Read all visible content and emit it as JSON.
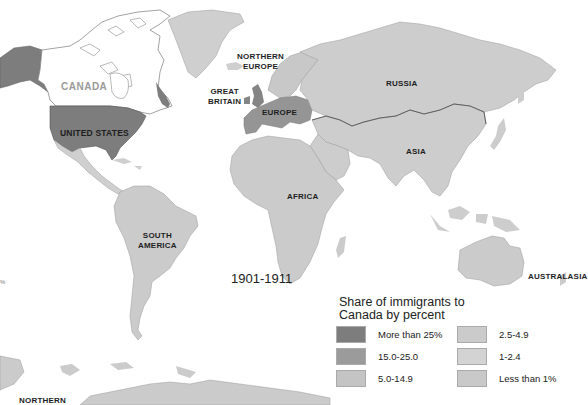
{
  "map": {
    "period": "1901-1911",
    "legend": {
      "title_line1": "Share of immigrants to",
      "title_line2": "Canada by percent",
      "items": [
        {
          "label": "More than 25%",
          "color": "#7d7d7d"
        },
        {
          "label": "15.0-25.0",
          "color": "#9b9b9b"
        },
        {
          "label": "5.0-14.9",
          "color": "#c4c4c4"
        },
        {
          "label": "2.5-4.9",
          "color": "#cbcbcb"
        },
        {
          "label": "1-2.4",
          "color": "#d3d3d3"
        },
        {
          "label": "Less than 1%",
          "color": "#c9c9c9"
        }
      ]
    },
    "regions": {
      "canada": "CANADA",
      "united_states": "UNITED STATES",
      "northern_europe_l1": "NORTHERN",
      "northern_europe_l2": "EUROPE",
      "great_britain_l1": "GREAT",
      "great_britain_l2": "BRITAIN",
      "europe": "EUROPE",
      "russia": "RUSSIA",
      "asia": "ASIA",
      "africa": "AFRICA",
      "south_america_l1": "SOUTH",
      "south_america_l2": "AMERICA",
      "australasia": "AUSTRALASIA",
      "northern_bottom": "NORTHERN"
    },
    "edge_fragment": "%",
    "colors": {
      "united_states": "#7d7d7d",
      "great_britain": "#858585",
      "europe": "#959595",
      "northern_europe": "#c8c8c8",
      "russia": "#cdcdcd",
      "asia": "#cdcdcd",
      "africa": "#cbcbcb",
      "south_america": "#cbcbcb",
      "australasia": "#cbcbcb",
      "greenland": "#cfcfcf",
      "canada": "#ffffff",
      "mexico": "#cfcfcf",
      "outline": "#9a9a9a",
      "border_dark": "#555555"
    }
  }
}
